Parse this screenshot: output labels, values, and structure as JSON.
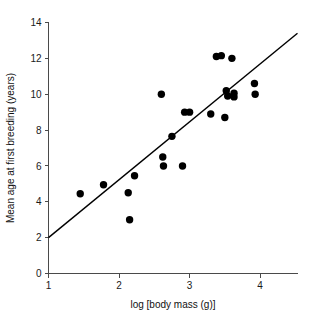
{
  "chart_data": {
    "type": "scatter",
    "title": "",
    "xlabel": "log [body mass (g)]",
    "ylabel": "Mean age at first breeding (years)",
    "xlim": [
      1,
      4.53
    ],
    "ylim": [
      0,
      14
    ],
    "xticks": [
      1,
      2,
      3,
      4
    ],
    "xtick_labels": [
      "1",
      "2",
      "3",
      "4"
    ],
    "yticks": [
      0,
      2,
      4,
      6,
      8,
      10,
      12,
      14
    ],
    "ytick_labels": [
      "0",
      "2",
      "4",
      "6",
      "8",
      "10",
      "12",
      "14"
    ],
    "grid": false,
    "legend": "none",
    "marker": "filled-circle",
    "marker_color": "#000000",
    "points": [
      {
        "x": 1.45,
        "y": 4.45
      },
      {
        "x": 1.78,
        "y": 4.95
      },
      {
        "x": 2.13,
        "y": 4.5
      },
      {
        "x": 2.15,
        "y": 3.0
      },
      {
        "x": 2.22,
        "y": 5.45
      },
      {
        "x": 2.6,
        "y": 10.0
      },
      {
        "x": 2.62,
        "y": 6.5
      },
      {
        "x": 2.63,
        "y": 6.0
      },
      {
        "x": 2.75,
        "y": 7.65
      },
      {
        "x": 2.9,
        "y": 6.0
      },
      {
        "x": 2.93,
        "y": 9.0
      },
      {
        "x": 3.0,
        "y": 9.0
      },
      {
        "x": 3.3,
        "y": 8.9
      },
      {
        "x": 3.38,
        "y": 12.1
      },
      {
        "x": 3.45,
        "y": 12.15
      },
      {
        "x": 3.5,
        "y": 8.7
      },
      {
        "x": 3.6,
        "y": 12.0
      },
      {
        "x": 3.52,
        "y": 10.2
      },
      {
        "x": 3.54,
        "y": 9.9
      },
      {
        "x": 3.63,
        "y": 10.05
      },
      {
        "x": 3.63,
        "y": 9.85
      },
      {
        "x": 3.92,
        "y": 10.6
      },
      {
        "x": 3.93,
        "y": 10.0
      }
    ],
    "trend_line": {
      "type": "linear-fit",
      "x_start": 1.0,
      "y_start": 2.0,
      "x_end": 4.53,
      "y_end": 13.4,
      "slope": 3.23,
      "intercept": -1.23,
      "color": "#000000"
    }
  }
}
